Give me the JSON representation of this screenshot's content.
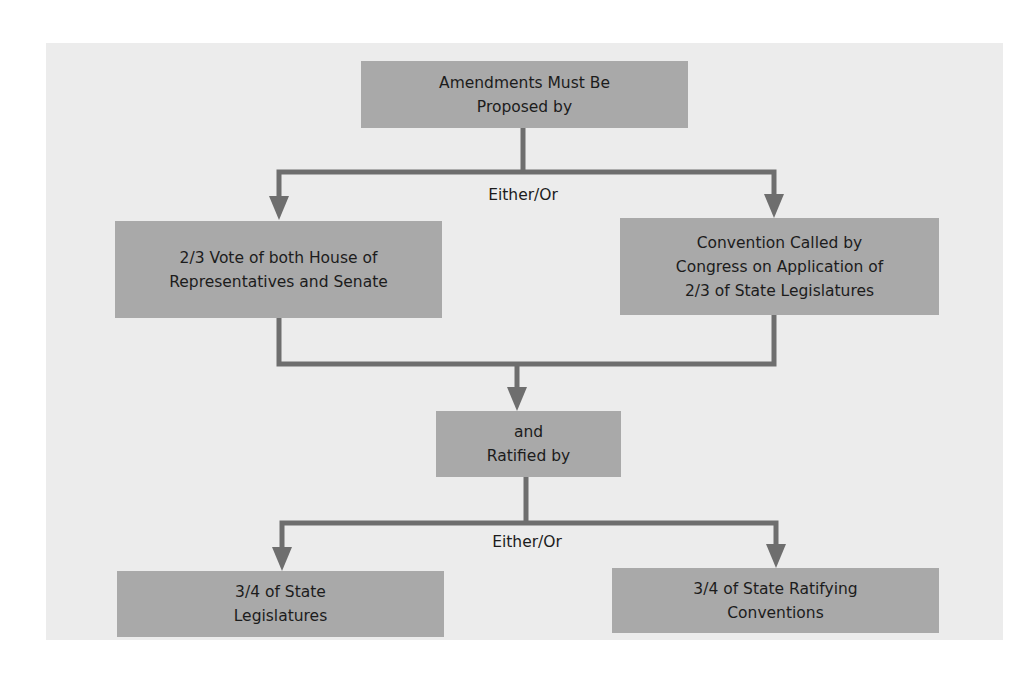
{
  "diagram": {
    "colors": {
      "panel_background": "#ececec",
      "box_fill": "#a9a9a9",
      "connector": "#6e6e6e",
      "text": "#1c1c1c"
    },
    "nodes": {
      "proposed": {
        "label": "Amendments Must Be\nProposed by"
      },
      "congress_vote": {
        "label": "2/3 Vote of both House of\nRepresentatives and Senate"
      },
      "convention": {
        "label": "Convention Called by\nCongress on Application of\n2/3 of State Legislatures"
      },
      "ratified": {
        "label": "and\nRatified by"
      },
      "state_legislatures": {
        "label": "3/4 of State\nLegislatures"
      },
      "state_conventions": {
        "label": "3/4 of State Ratifying\nConventions"
      }
    },
    "edge_labels": {
      "proposal_split": "Either/Or",
      "ratification_split": "Either/Or"
    },
    "edges": [
      {
        "from": "proposed",
        "to": "congress_vote"
      },
      {
        "from": "proposed",
        "to": "convention"
      },
      {
        "from": "congress_vote",
        "to": "ratified"
      },
      {
        "from": "convention",
        "to": "ratified"
      },
      {
        "from": "ratified",
        "to": "state_legislatures"
      },
      {
        "from": "ratified",
        "to": "state_conventions"
      }
    ]
  }
}
